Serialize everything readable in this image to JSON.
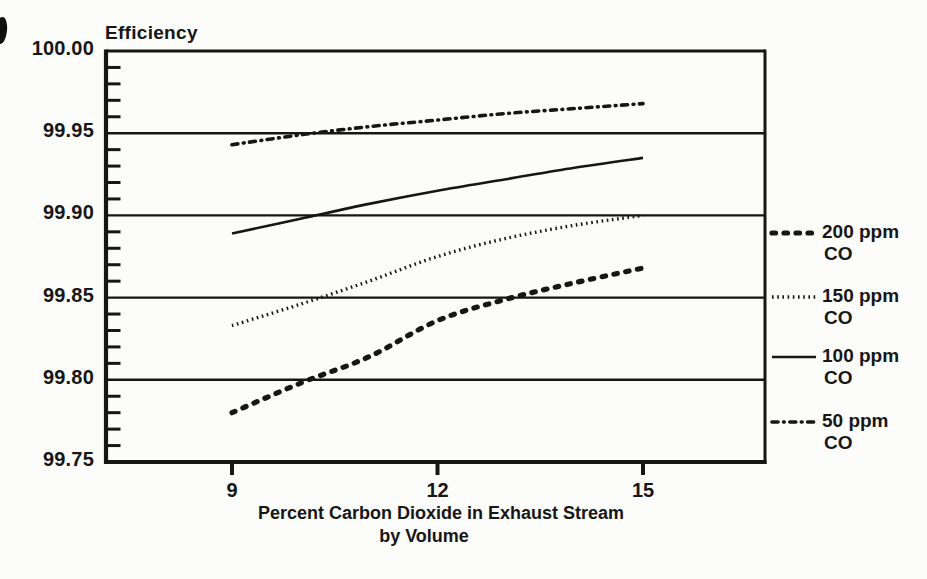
{
  "colors": {
    "ink": "#161616",
    "paper": "#fcfcfa"
  },
  "chart_data": {
    "type": "line",
    "title": "",
    "ylabel": "Efficiency",
    "xlabel_line1": "Percent Carbon Dioxide in Exhaust Stream",
    "xlabel_line2": "by Volume",
    "xlim": [
      7.16,
      16.8
    ],
    "ylim": [
      99.75,
      100.0
    ],
    "x_ticks": [
      9,
      12,
      15
    ],
    "y_ticks": [
      {
        "label": "100.00",
        "value": 100.0
      },
      {
        "label": "99.95",
        "value": 99.95
      },
      {
        "label": "99.90",
        "value": 99.9
      },
      {
        "label": "99.85",
        "value": 99.85
      },
      {
        "label": "99.80",
        "value": 99.8
      },
      {
        "label": "99.75",
        "value": 99.75
      }
    ],
    "y_minor_tick_step": 0.01,
    "grid": "horizontal lines at each major y tick",
    "legend_position": "right",
    "x": [
      9,
      10,
      11,
      12,
      13,
      14,
      15
    ],
    "series": [
      {
        "name": "200 ppm CO",
        "legend_label": "200 ppm",
        "legend_sublabel": "CO",
        "style": "bold-dashed",
        "values": [
          99.78,
          99.798,
          99.814,
          99.836,
          99.849,
          99.859,
          99.868
        ]
      },
      {
        "name": "150 ppm CO",
        "legend_label": "150 ppm",
        "legend_sublabel": "CO",
        "style": "fine-dotted",
        "values": [
          99.833,
          99.846,
          99.86,
          99.875,
          99.886,
          99.894,
          99.9
        ]
      },
      {
        "name": "100 ppm CO",
        "legend_label": "100 ppm",
        "legend_sublabel": "CO",
        "style": "solid",
        "values": [
          99.889,
          99.898,
          99.907,
          99.915,
          99.922,
          99.929,
          99.935
        ]
      },
      {
        "name": "50 ppm CO",
        "legend_label": "50 ppm",
        "legend_sublabel": "CO",
        "style": "dash-dot",
        "values": [
          99.943,
          99.949,
          99.954,
          99.958,
          99.962,
          99.965,
          99.968
        ]
      }
    ]
  }
}
